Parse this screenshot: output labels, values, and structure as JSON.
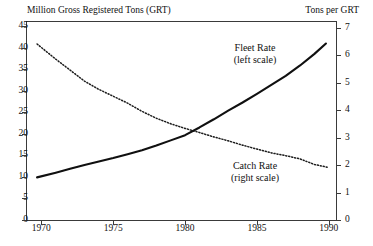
{
  "chart_data": {
    "type": "line",
    "title": "",
    "xlabel": "",
    "left_axis_title": "Million Gross Registered Tons (GRT)",
    "right_axis_title": "Tons per GRT",
    "grid": false,
    "legend_position": "inline-annotation",
    "xlim": [
      1969,
      1990.5
    ],
    "xticks": [
      1970,
      1975,
      1980,
      1985,
      1990
    ],
    "xtick_labels": [
      "1970",
      "1975",
      "1980",
      "1985",
      "1990"
    ],
    "left_ylim": [
      0,
      46
    ],
    "left_yticks": [
      0,
      5,
      10,
      15,
      20,
      25,
      30,
      35,
      40,
      45
    ],
    "left_ytick_labels": [
      "0",
      "5",
      "10",
      "15",
      "20",
      "25",
      "30",
      "35",
      "40",
      "45"
    ],
    "right_ylim": [
      0,
      7.2
    ],
    "right_yticks": [
      0,
      1,
      2,
      3,
      4,
      5,
      6,
      7
    ],
    "right_ytick_labels": [
      "0",
      "1",
      "2",
      "3",
      "4",
      "5",
      "6",
      "7"
    ],
    "series": [
      {
        "name": "Fleet Rate",
        "axis": "left",
        "style": "solid",
        "color": "#101010",
        "annotation": "Fleet Rate",
        "annotation_scale": "(left scale)",
        "x": [
          1969.7,
          1971,
          1972,
          1973,
          1974,
          1975,
          1976,
          1977,
          1978,
          1979,
          1980,
          1981,
          1982,
          1983,
          1984,
          1985,
          1986,
          1987,
          1988,
          1989,
          1989.8
        ],
        "values": [
          9.9,
          11.0,
          11.9,
          12.8,
          13.6,
          14.4,
          15.3,
          16.2,
          17.3,
          18.5,
          19.7,
          21.5,
          23.4,
          25.4,
          27.3,
          29.3,
          31.4,
          33.5,
          35.9,
          38.6,
          41.0
        ]
      },
      {
        "name": "Catch Rate",
        "axis": "right",
        "style": "dotted",
        "color": "#1c1c1c",
        "annotation": "Catch Rate",
        "annotation_scale": "(right scale)",
        "x": [
          1969.7,
          1971,
          1972,
          1973,
          1974,
          1975,
          1976,
          1977,
          1978,
          1979,
          1980,
          1981,
          1982,
          1983,
          1984,
          1985,
          1986,
          1987,
          1988,
          1989,
          1989.9
        ],
        "values": [
          6.4,
          5.85,
          5.45,
          5.05,
          4.75,
          4.5,
          4.25,
          3.95,
          3.7,
          3.5,
          3.33,
          3.18,
          3.02,
          2.88,
          2.72,
          2.58,
          2.44,
          2.34,
          2.22,
          2.02,
          1.92
        ]
      }
    ]
  }
}
